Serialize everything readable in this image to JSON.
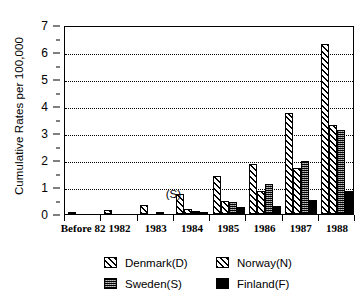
{
  "chart_data": {
    "type": "bar",
    "title": "",
    "xlabel": "",
    "ylabel": "Cumulative Rates per 100,000",
    "ylim": [
      0,
      7
    ],
    "yticks": [
      0,
      1,
      2,
      3,
      4,
      5,
      6,
      7
    ],
    "grid": true,
    "legend_position": "bottom",
    "categories": [
      "Before 82",
      "1982",
      "1983",
      "1984",
      "1985",
      "1986",
      "1987",
      "1988"
    ],
    "series": [
      {
        "name": "Denmark(D)",
        "pattern": "diagonal-hatch",
        "values": [
          0.05,
          0.15,
          0.35,
          0.75,
          1.42,
          1.87,
          3.75,
          6.3
        ]
      },
      {
        "name": "Norway(N)",
        "pattern": "diagonal-hatch",
        "values": [
          0.0,
          0.0,
          0.0,
          0.17,
          0.5,
          0.85,
          1.72,
          3.3
        ]
      },
      {
        "name": "Sweden(S)",
        "pattern": "cross-stipple",
        "values": [
          0.0,
          0.0,
          0.05,
          0.12,
          0.45,
          1.1,
          1.97,
          3.1
        ]
      },
      {
        "name": "Finland(F)",
        "pattern": "solid-black",
        "values": [
          0.0,
          0.0,
          0.0,
          0.07,
          0.25,
          0.3,
          0.52,
          0.87
        ]
      }
    ],
    "annotations": [
      {
        "text": "(S)",
        "near_category": "1983"
      }
    ]
  },
  "axis": {
    "y_title": "Cumulative Rates per 100,000",
    "y_tick_labels": [
      "0",
      "1",
      "2",
      "3",
      "4",
      "5",
      "6",
      "7"
    ],
    "x_tick_labels": [
      "Before 82",
      "1982",
      "1983",
      "1984",
      "1985",
      "1986",
      "1987",
      "1988"
    ]
  },
  "legend": {
    "entries": [
      {
        "label": "Denmark(D)",
        "swatch": "denmark"
      },
      {
        "label": "Norway(N)",
        "swatch": "norway"
      },
      {
        "label": "Sweden(S)",
        "swatch": "sweden"
      },
      {
        "label": "Finland(F)",
        "swatch": "finland"
      }
    ]
  },
  "annotations": {
    "sweden_marker": "(S)"
  },
  "colors": {
    "foreground": "#000000",
    "background": "#ffffff"
  }
}
